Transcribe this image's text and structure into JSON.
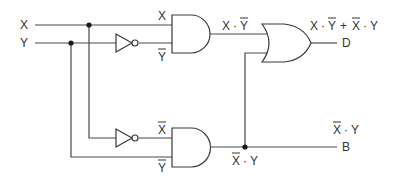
{
  "diagram": {
    "inputs": [
      {
        "id": "X",
        "label": "X"
      },
      {
        "id": "Y",
        "label": "Y"
      }
    ],
    "outputs": [
      {
        "id": "D",
        "label": "D",
        "expression": "X·Ȳ + X̄·Y"
      },
      {
        "id": "B",
        "label": "B",
        "expression": "X̄·Y"
      }
    ],
    "gates": [
      {
        "id": "not1",
        "type": "NOT",
        "input": "Y",
        "output": "Ȳ"
      },
      {
        "id": "not2",
        "type": "NOT",
        "input": "X",
        "output": "X̄"
      },
      {
        "id": "and1",
        "type": "AND",
        "inputs": [
          "X",
          "Ȳ"
        ],
        "output": "X·Ȳ"
      },
      {
        "id": "and2",
        "type": "AND",
        "inputs": [
          "X̄",
          "Y"
        ],
        "output": "X̄·Y"
      },
      {
        "id": "or1",
        "type": "OR",
        "inputs": [
          "X·Ȳ",
          "X̄·Y"
        ],
        "output": "D"
      }
    ],
    "labels": {
      "input_x": "X",
      "input_y": "Y",
      "and1_in_x": "X",
      "and1_in_ybar": "Y",
      "and1_out_x": "X",
      "and1_out_dot": "·",
      "and1_out_ybar": "Y",
      "d_expr_x1": "X",
      "d_expr_dot1": "·",
      "d_expr_ybar": "Y",
      "d_expr_plus": "+",
      "d_expr_xbar": "X",
      "d_expr_dot2": "·",
      "d_expr_y": "Y",
      "output_d": "D",
      "and2_in_xbar": "X",
      "and2_in_ybar": "Y",
      "and2_out_xbar": "X",
      "and2_out_dot": "·",
      "and2_out_y": "Y",
      "b_expr_xbar": "X",
      "b_expr_dot": "·",
      "b_expr_y": "Y",
      "output_b": "B"
    }
  }
}
